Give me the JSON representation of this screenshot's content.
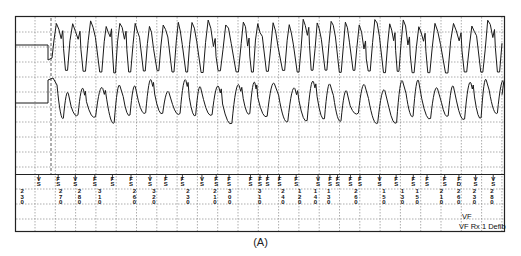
{
  "figure": {
    "caption": "(A)",
    "trace_color": "#1a1a1a",
    "grid_color": "#8a8a8a",
    "frame_color": "#222222"
  },
  "channels": [
    {
      "name": "atrial-egm",
      "description": "upper electrogram channel, flat baseline then rapid irregular tachyarrhythmia",
      "baseline_until_fraction": 0.08,
      "style": "sharp"
    },
    {
      "name": "ventricular-egm",
      "description": "lower electrogram channel, flat baseline then sinusoidal rapid oscillations",
      "baseline_until_fraction": 0.08,
      "style": "sinusoidal"
    }
  ],
  "marker_channel": {
    "top_markers": [
      {
        "label": "VS",
        "t": 0.035
      },
      {
        "label": "FS",
        "t": 0.076
      },
      {
        "label": "VS",
        "t": 0.112
      },
      {
        "label": "FS",
        "t": 0.153
      },
      {
        "label": "FS",
        "t": 0.19
      },
      {
        "label": "FS",
        "t": 0.229
      },
      {
        "label": "VS",
        "t": 0.269
      },
      {
        "label": "FS",
        "t": 0.302
      },
      {
        "label": "FS",
        "t": 0.337
      },
      {
        "label": "VS",
        "t": 0.378
      },
      {
        "label": "FS",
        "t": 0.408
      },
      {
        "label": "FS",
        "t": 0.435
      },
      {
        "label": "FS",
        "t": 0.48
      },
      {
        "label": "FS",
        "t": 0.5
      },
      {
        "label": "FS",
        "t": 0.516
      },
      {
        "label": "FS",
        "t": 0.541
      },
      {
        "label": "FS",
        "t": 0.576
      },
      {
        "label": "VS",
        "t": 0.622
      },
      {
        "label": "FS",
        "t": 0.647
      },
      {
        "label": "FS",
        "t": 0.663
      },
      {
        "label": "FS",
        "t": 0.69
      },
      {
        "label": "FS",
        "t": 0.71
      },
      {
        "label": "VS",
        "t": 0.751
      },
      {
        "label": "FS",
        "t": 0.786
      },
      {
        "label": "FS",
        "t": 0.822
      },
      {
        "label": "FS",
        "t": 0.851
      },
      {
        "label": "FS",
        "t": 0.888
      },
      {
        "label": "FD",
        "t": 0.918
      },
      {
        "label": "VS",
        "t": 0.953
      },
      {
        "label": "VS",
        "t": 0.99
      }
    ],
    "interval_values": [
      {
        "value": "230",
        "t": 0.013
      },
      {
        "value": "270",
        "t": 0.094
      },
      {
        "value": "280",
        "t": 0.133
      },
      {
        "value": "310",
        "t": 0.176
      },
      {
        "value": "260",
        "t": 0.249
      },
      {
        "value": "320",
        "t": 0.29
      },
      {
        "value": "230",
        "t": 0.361
      },
      {
        "value": "210",
        "t": 0.418
      },
      {
        "value": "300",
        "t": 0.449
      },
      {
        "value": "310",
        "t": 0.512
      },
      {
        "value": "240",
        "t": 0.561
      },
      {
        "value": "120",
        "t": 0.596
      },
      {
        "value": "140",
        "t": 0.629
      },
      {
        "value": "130",
        "t": 0.657
      },
      {
        "value": "260",
        "t": 0.714
      },
      {
        "value": "150",
        "t": 0.773
      },
      {
        "value": "130",
        "t": 0.812
      },
      {
        "value": "150",
        "t": 0.843
      },
      {
        "value": "210",
        "t": 0.894
      },
      {
        "value": "260",
        "t": 0.93
      },
      {
        "value": "230",
        "t": 0.963
      },
      {
        "value": "280",
        "t": 1.0
      }
    ],
    "annotations": [
      "VF",
      "VF Rx 1 Defib"
    ]
  }
}
